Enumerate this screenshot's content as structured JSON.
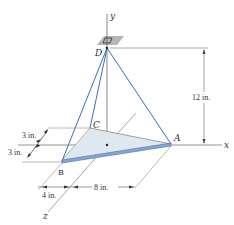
{
  "figure": {
    "type": "statics 3D cable diagram",
    "axes": {
      "x": "x",
      "y": "y",
      "z": "z"
    },
    "points": {
      "A": "A",
      "B": "B",
      "C": "C",
      "D": "D"
    },
    "dimensions": {
      "height": "12 in.",
      "c_offset": "3 in.",
      "b_offset": "3 in.",
      "b_x": "4 in.",
      "a_x": "8 in."
    },
    "colors": {
      "cable": "#3b6fb6",
      "plate_fill": "#dfe8ef",
      "plate_edge": "#6a8fbf",
      "support": "#b5b5b5",
      "line": "#555555"
    }
  }
}
